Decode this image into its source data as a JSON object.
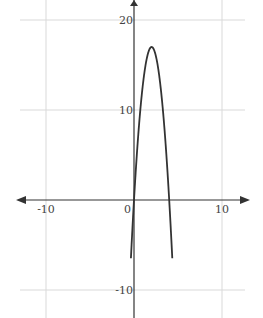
{
  "chart_data": {
    "type": "line",
    "title": "",
    "xlabel": "",
    "ylabel": "",
    "xlim": [
      -13,
      13.5
    ],
    "ylim": [
      -13,
      22
    ],
    "grid": true,
    "x_ticks": [
      -10,
      0,
      10
    ],
    "y_ticks": [
      20,
      10,
      -10
    ],
    "x_tick_labels": [
      "-10",
      "0",
      "10"
    ],
    "y_tick_labels": [
      "20",
      "10",
      "-10"
    ],
    "series": [
      {
        "name": "f(x)",
        "expression": "-4.25x(x-4)",
        "roots": [
          0,
          4
        ],
        "vertex": [
          2,
          17
        ],
        "x": [
          -0.3,
          0,
          0.5,
          1,
          1.5,
          2,
          2.5,
          3,
          3.5,
          4,
          4.3
        ],
        "values": [
          -5.5,
          0,
          7.4,
          12.75,
          15.9,
          17,
          15.9,
          12.75,
          7.4,
          0,
          -5.5
        ]
      }
    ],
    "colors": {
      "curve": "#333333",
      "axis": "#333333",
      "grid": "#d9d9d9"
    }
  }
}
